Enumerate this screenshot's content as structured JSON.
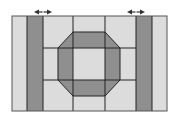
{
  "diagram": {
    "type": "quilt-block-pattern",
    "colors": {
      "background": "#ffffff",
      "light_fill": "#dcdcdc",
      "dark_fill": "#8f8f8f",
      "line": "#222222"
    },
    "outer_rect": {
      "x": 12,
      "y": 16,
      "w": 155,
      "h": 95
    },
    "vertical_lines": [
      27,
      43,
      73,
      105,
      136,
      152
    ],
    "horizontal_lines": {
      "y": [
        48,
        80
      ],
      "x_from": 43,
      "x_to": 136
    },
    "dark_strips": [
      {
        "x": 27,
        "w": 16
      },
      {
        "x": 136,
        "w": 16
      }
    ],
    "octagon": {
      "points": "73,32 105,32 120,48 120,80 105,96 73,96 58,80 58,48",
      "inner_square": {
        "x": 73,
        "y": 48,
        "w": 32,
        "h": 32
      }
    },
    "arrows": [
      {
        "name": "left-strip-arrow",
        "x1": 34,
        "x2": 52,
        "y": 12
      },
      {
        "name": "right-strip-arrow",
        "x1": 127,
        "x2": 145,
        "y": 12
      }
    ]
  }
}
